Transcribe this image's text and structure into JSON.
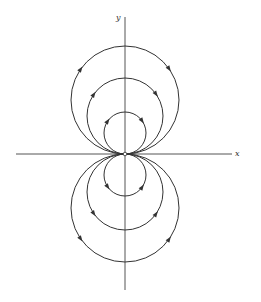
{
  "diagram": {
    "type": "phase-portrait",
    "axes": {
      "x_label": "x",
      "y_label": "y",
      "origin": [
        125,
        154
      ],
      "x_range_px": [
        16,
        232
      ],
      "y_range_px": [
        17,
        290
      ]
    },
    "colors": {
      "stroke": "#333333",
      "axis": "#555555",
      "background": "#ffffff"
    },
    "circles": [
      {
        "name": "upper-large",
        "cx": 125,
        "cy": 100,
        "r": 54,
        "direction": "clockwise"
      },
      {
        "name": "upper-medium",
        "cx": 125,
        "cy": 116,
        "r": 38,
        "direction": "clockwise"
      },
      {
        "name": "upper-small",
        "cx": 125,
        "cy": 133,
        "r": 21,
        "direction": "clockwise"
      },
      {
        "name": "lower-small",
        "cx": 125,
        "cy": 175,
        "r": 21,
        "direction": "counterclockwise"
      },
      {
        "name": "lower-medium",
        "cx": 125,
        "cy": 192,
        "r": 38,
        "direction": "counterclockwise"
      },
      {
        "name": "lower-large",
        "cx": 125,
        "cy": 208,
        "r": 54,
        "direction": "counterclockwise"
      }
    ]
  }
}
